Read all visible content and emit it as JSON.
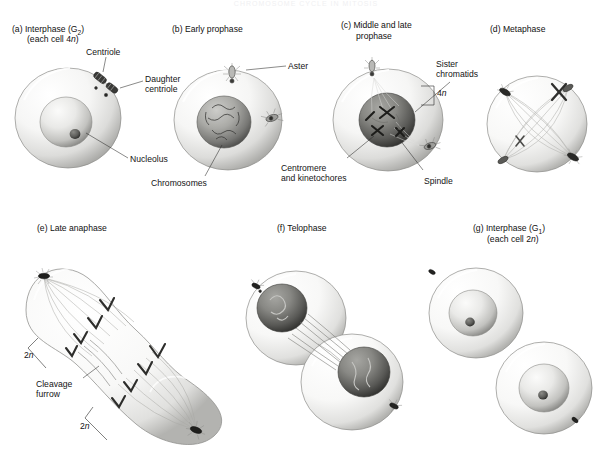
{
  "figure": {
    "title_faint": "CHROMOSOME CYCLE IN MITOSIS",
    "background_color": "#ffffff",
    "ink_color": "#1a1a1a"
  },
  "panels": [
    {
      "id": "a",
      "tag": "(a)",
      "title_line1": "Interphase (G",
      "title_sub": "2",
      "title_line1_end": ")",
      "title_line2_pre": "(each cell 4",
      "title_line2_ital": "n",
      "title_line2_post": ")",
      "labels": [
        {
          "name": "centriole",
          "text": "Centriole"
        },
        {
          "name": "daughter-centriole",
          "text": "Daughter\ncentriole"
        },
        {
          "name": "nucleolus",
          "text": "Nucleolus"
        }
      ]
    },
    {
      "id": "b",
      "tag": "(b)",
      "title_line1": "Early prophase",
      "labels": [
        {
          "name": "aster",
          "text": "Aster"
        },
        {
          "name": "chromosomes",
          "text": "Chromosomes"
        }
      ]
    },
    {
      "id": "c",
      "tag": "(c)",
      "title_line1": "Middle and late",
      "title_line2": "prophase",
      "labels": [
        {
          "name": "sister-chromatids",
          "text": "Sister\nchromatids"
        },
        {
          "name": "ploidy-4n",
          "text": "4n"
        },
        {
          "name": "centromere-kinetochores",
          "text": "Centromere\nand kinetochores"
        },
        {
          "name": "spindle",
          "text": "Spindle"
        }
      ]
    },
    {
      "id": "d",
      "tag": "(d)",
      "title_line1": "Metaphase",
      "labels": []
    },
    {
      "id": "e",
      "tag": "(e)",
      "title_line1": "Late anaphase",
      "labels": [
        {
          "name": "ploidy-2n-upper",
          "text": "2n"
        },
        {
          "name": "cleavage-furrow",
          "text": "Cleavage\nfurrow"
        },
        {
          "name": "ploidy-2n-lower",
          "text": "2n"
        }
      ]
    },
    {
      "id": "f",
      "tag": "(f)",
      "title_line1": "Telophase",
      "labels": []
    },
    {
      "id": "g",
      "tag": "(g)",
      "title_line1": "Interphase (G",
      "title_sub": "1",
      "title_line1_end": ")",
      "title_line2_pre": "(each cell 2",
      "title_line2_ital": "n",
      "title_line2_post": ")",
      "labels": []
    }
  ],
  "text": {
    "a_tag": "(a)",
    "a_t1": "Interphase (G",
    "a_sub": "2",
    "a_t1e": ")",
    "a_t2a": "(each cell 4",
    "a_t2i": "n",
    "a_t2b": ")",
    "a_centriole": "Centriole",
    "a_daughter1": "Daughter",
    "a_daughter2": "centriole",
    "a_nucleolus": "Nucleolus",
    "b_tag": "(b)",
    "b_t1": "Early prophase",
    "b_aster": "Aster",
    "b_chromosomes": "Chromosomes",
    "c_tag": "(c)",
    "c_t1": "Middle and late",
    "c_t2": "prophase",
    "c_sister1": "Sister",
    "c_sister2": "chromatids",
    "c_4n_num": "4",
    "c_4n_ital": "n",
    "c_centromere1": "Centromere",
    "c_centromere2": "and kinetochores",
    "c_spindle": "Spindle",
    "d_tag": "(d)",
    "d_t1": "Metaphase",
    "e_tag": "(e)",
    "e_t1": "Late anaphase",
    "e_2n_up_num": "2",
    "e_2n_up_ital": "n",
    "e_cleav1": "Cleavage",
    "e_cleav2": "furrow",
    "e_2n_lo_num": "2",
    "e_2n_lo_ital": "n",
    "f_tag": "(f)",
    "f_t1": "Telophase",
    "g_tag": "(g)",
    "g_t1": "Interphase (G",
    "g_sub": "1",
    "g_t1e": ")",
    "g_t2a": "(each cell 2",
    "g_t2i": "n",
    "g_t2b": ")"
  }
}
